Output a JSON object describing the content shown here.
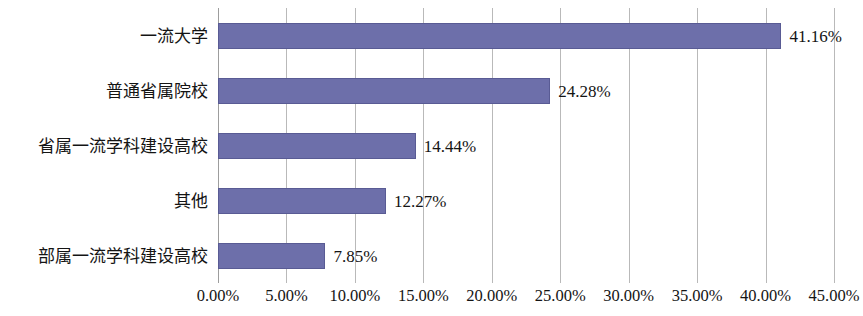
{
  "chart_data": {
    "type": "bar",
    "orientation": "horizontal",
    "title": "",
    "subtitle": "",
    "xlabel": "",
    "ylabel": "",
    "categories": [
      "一流大学",
      "普通省属院校",
      "省属一流学科建设高校",
      "其他",
      "部属一流学科建设高校"
    ],
    "values": [
      41.16,
      24.28,
      14.44,
      12.27,
      7.85
    ],
    "data_labels": [
      "41.16%",
      "24.28%",
      "14.44%",
      "12.27%",
      "7.85%"
    ],
    "xlim": [
      0,
      45
    ],
    "xtick_values": [
      0,
      5,
      10,
      15,
      20,
      25,
      30,
      35,
      40,
      45
    ],
    "xtick_labels": [
      "0.00%",
      "5.00%",
      "10.00%",
      "15.00%",
      "20.00%",
      "25.00%",
      "30.00%",
      "35.00%",
      "40.00%",
      "45.00%"
    ],
    "grid": {
      "vertical": true,
      "horizontal": false,
      "color": "#b9b9b9"
    },
    "legend": {
      "visible": false,
      "position": "none",
      "entries": []
    },
    "series": [
      {
        "name": "",
        "color": "#6d6faa",
        "border_color": "#595b94",
        "values": [
          41.16,
          24.28,
          14.44,
          12.27,
          7.85
        ]
      }
    ]
  },
  "colors": {
    "bar_fill": "#6d6faa",
    "bar_border": "#595b94",
    "gridline": "#b9b9b9",
    "axis_line": "#9d9d9d",
    "text": "#141414",
    "background": "#ffffff"
  }
}
